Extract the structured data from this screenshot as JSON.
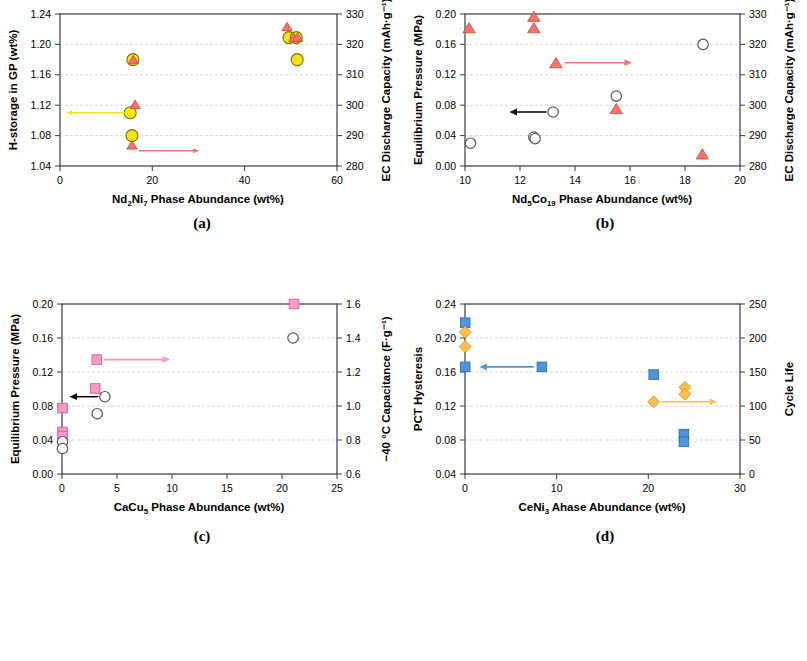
{
  "figure": {
    "panels": [
      {
        "letter": "(a)",
        "xlabel_parts": [
          "Nd",
          "2",
          "Ni",
          "7",
          " Phase Abundance (wt%)"
        ],
        "xlabel": "Nd2Ni7 Phase Abundance (wt%)",
        "ylabel_left": "H-storage in GP (wt%)",
        "ylabel_right": "EC Discharge Capacity (mAh·g⁻¹)",
        "xlim": [
          0,
          60
        ],
        "xticks": [
          "0",
          "20",
          "40",
          "60"
        ],
        "ylim_left": [
          1.04,
          1.24
        ],
        "yticks_left": [
          "1.04",
          "1.08",
          "1.12",
          "1.16",
          "1.20",
          "1.24"
        ],
        "ylim_right": [
          280,
          330
        ],
        "yticks_right": [
          "280",
          "290",
          "300",
          "310",
          "320",
          "330"
        ],
        "series": [
          {
            "name": "H-storage in GP",
            "marker": "circle",
            "color": "#F2E21A",
            "edge": "#7a6f00",
            "axis": "left",
            "points": [
              [
                15.2,
                1.11
              ],
              [
                15.6,
                1.08
              ],
              [
                15.8,
                1.18
              ],
              [
                49.6,
                1.21
              ],
              [
                51.2,
                1.21
              ],
              [
                51.4,
                1.18
              ]
            ]
          },
          {
            "name": "EC Discharge Capacity",
            "marker": "triangle",
            "color": "#F1756A",
            "edge": "#c1483f",
            "axis": "right",
            "points": [
              [
                15.6,
                285.0
              ],
              [
                16.3,
                299.8
              ],
              [
                15.9,
                315.0
              ],
              [
                49.2,
                326.5
              ],
              [
                50.7,
                322.8
              ],
              [
                51.5,
                323.0
              ]
            ]
          }
        ],
        "arrows": [
          {
            "name": "left-arrow-hstorage",
            "color": "#F2E21A",
            "x_from": 14.2,
            "x_to": 1.8,
            "y_left": 1.11,
            "dir": "left"
          },
          {
            "name": "right-arrow-capacity",
            "color": "#F1756A",
            "x_from": 17.0,
            "x_to": 29.0,
            "y_left": 1.06,
            "dir": "right"
          }
        ]
      },
      {
        "letter": "(b)",
        "xlabel_parts": [
          "Nd",
          "5",
          "Co",
          "19",
          " Phase Abundance (wt%)"
        ],
        "xlabel": "Nd5Co19 Phase Abundance (wt%)",
        "ylabel_left": "Equilibrium Pressure (MPa)",
        "ylabel_right": "EC Discharge Capacity (mAh·g⁻¹)",
        "xlim": [
          10,
          20
        ],
        "xticks": [
          "10",
          "12",
          "14",
          "16",
          "18",
          "20"
        ],
        "ylim_left": [
          0.0,
          0.2
        ],
        "yticks_left": [
          "0.00",
          "0.04",
          "0.08",
          "0.12",
          "0.16",
          "0.20"
        ],
        "ylim_right": [
          280,
          330
        ],
        "yticks_right": [
          "280",
          "290",
          "300",
          "310",
          "320",
          "330"
        ],
        "series": [
          {
            "name": "Equilibrium Pressure",
            "marker": "open-circle",
            "color": "#ffffff",
            "edge": "#555555",
            "axis": "left",
            "points": [
              [
                10.2,
                0.03
              ],
              [
                12.5,
                0.038
              ],
              [
                12.55,
                0.036
              ],
              [
                13.2,
                0.071
              ],
              [
                15.5,
                0.092
              ],
              [
                18.65,
                0.16
              ]
            ]
          },
          {
            "name": "EC Discharge Capacity",
            "marker": "triangle",
            "color": "#F1756A",
            "edge": "#c1483f",
            "axis": "left",
            "points": [
              [
                10.15,
                0.172
              ],
              [
                12.5,
                0.186
              ],
              [
                12.5,
                0.172
              ],
              [
                13.3,
                0.14
              ],
              [
                15.5,
                0.08
              ],
              [
                18.6,
                0.02
              ]
            ]
          }
        ],
        "arrows": [
          {
            "name": "left-arrow-pressure",
            "color": "#000000",
            "x_from": 13.0,
            "x_to": 11.1,
            "y_left": 0.071,
            "dir": "left"
          },
          {
            "name": "right-arrow-capacity",
            "color": "#F1756A",
            "x_from": 13.7,
            "x_to": 15.7,
            "y_left": 0.14,
            "dir": "right"
          }
        ]
      },
      {
        "letter": "(c)",
        "xlabel_parts": [
          "CaCu",
          "5",
          "",
          "",
          " Phase Abundance (wt%)"
        ],
        "xlabel": "CaCu5 Phase Abundance (wt%)",
        "ylabel_left": "Equilibrium Pressure (MPa)",
        "ylabel_right": "−40 °C Capacitance (F·g⁻¹)",
        "xlim": [
          0,
          25
        ],
        "xticks": [
          "0",
          "5",
          "10",
          "15",
          "20",
          "25"
        ],
        "ylim_left": [
          0.0,
          0.2
        ],
        "yticks_left": [
          "0.00",
          "0.04",
          "0.08",
          "0.12",
          "0.16",
          "0.20"
        ],
        "ylim_right": [
          0.6,
          1.6
        ],
        "yticks_right": [
          "0.6",
          "0.8",
          "1.0",
          "1.2",
          "1.4",
          "1.6"
        ],
        "series": [
          {
            "name": "Equilibrium Pressure",
            "marker": "open-circle",
            "color": "#ffffff",
            "edge": "#555555",
            "axis": "left",
            "points": [
              [
                0.05,
                0.038
              ],
              [
                0.05,
                0.03
              ],
              [
                3.2,
                0.071
              ],
              [
                3.9,
                0.091
              ],
              [
                21.0,
                0.16
              ]
            ]
          },
          {
            "name": "-40 C Capacitance",
            "marker": "square",
            "color": "#F69BC4",
            "edge": "#d4619b",
            "axis": "left",
            "points": [
              [
                0.05,
                0.054
              ],
              [
                0.05,
                0.049
              ],
              [
                0.05,
                0.082
              ],
              [
                3.2,
                0.105
              ],
              [
                3.35,
                0.139
              ],
              [
                21.0,
                0.2
              ]
            ]
          }
        ],
        "arrows": [
          {
            "name": "left-arrow-pressure",
            "color": "#000000",
            "x_from": 3.3,
            "x_to": 0.6,
            "y_left": 0.091,
            "dir": "left"
          },
          {
            "name": "right-arrow-capacitance",
            "color": "#F69BC4",
            "x_from": 4.0,
            "x_to": 9.8,
            "y_left": 0.139,
            "dir": "right"
          }
        ]
      },
      {
        "letter": "(d)",
        "xlabel_parts": [
          "CeNi",
          "3",
          "",
          "",
          " Ahase Abundance (wt%)"
        ],
        "xlabel": "CeNi3 Ahase Abundance (wt%)",
        "ylabel_left": "PCT Hysteresis",
        "ylabel_right": "Cycle Life",
        "xlim": [
          0,
          30
        ],
        "xticks": [
          "0",
          "10",
          "20",
          "30"
        ],
        "ylim_left": [
          0.04,
          0.24
        ],
        "yticks_left": [
          "0.04",
          "0.08",
          "0.12",
          "0.16",
          "0.20",
          "0.24"
        ],
        "ylim_right": [
          0,
          250
        ],
        "yticks_right": [
          "0",
          "50",
          "100",
          "150",
          "200",
          "250"
        ],
        "series": [
          {
            "name": "PCT Hysteresis",
            "marker": "square",
            "color": "#4E95D9",
            "edge": "#2f6fae",
            "axis": "left",
            "points": [
              [
                0.1,
                0.221
              ],
              [
                0.1,
                0.169
              ],
              [
                8.5,
                0.169
              ],
              [
                20.7,
                0.16
              ],
              [
                24.0,
                0.09
              ],
              [
                24.0,
                0.081
              ]
            ]
          },
          {
            "name": "Cycle Life",
            "marker": "diamond",
            "color": "#F9C04B",
            "edge": "#d69a22",
            "axis": "left",
            "points": [
              [
                0.1,
                0.205
              ],
              [
                0.1,
                0.188
              ],
              [
                20.7,
                0.128
              ],
              [
                24.1,
                0.145
              ],
              [
                24.1,
                0.137
              ]
            ]
          }
        ],
        "arrows": [
          {
            "name": "left-arrow-hysteresis",
            "color": "#4E95D9",
            "x_from": 7.5,
            "x_to": 1.7,
            "y_left": 0.169,
            "dir": "left"
          },
          {
            "name": "right-arrow-cyclelife",
            "color": "#F9C04B",
            "x_from": 21.6,
            "x_to": 27.4,
            "y_left": 0.128,
            "dir": "right"
          }
        ]
      }
    ]
  }
}
